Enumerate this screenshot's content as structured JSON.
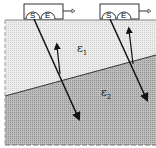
{
  "diagram": {
    "type": "two-layer subsurface radar schematic",
    "sensors": [
      {
        "source_label": "S",
        "receiver_label": "E"
      },
      {
        "source_label": "S",
        "receiver_label": "E"
      }
    ],
    "layers": [
      {
        "label": "ε",
        "sub": "1",
        "color": "#e8e8e8"
      },
      {
        "label": "ε",
        "sub": "2",
        "color": "#b4b4b4"
      }
    ]
  }
}
